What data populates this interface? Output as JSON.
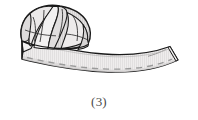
{
  "figure": {
    "caption": "(3)",
    "step_number": "3",
    "colors": {
      "outline": "#1a1a1a",
      "band_fill": "#eceaea",
      "band_fill_shadow": "#dedcdc",
      "rosette_fill": "#e6e4e4",
      "rosette_fill_dark": "#d2d0d0",
      "rosette_fill_light": "#f4f3f3",
      "stitch_dash": "#9b9b9b",
      "hatch": "#dcdada",
      "caption_text": "#4a4a4a",
      "background": "#ffffff"
    },
    "parts": {
      "rosette_label": "gathered-rosette",
      "band_label": "curved-band",
      "stitch_label": "dashed-stitch-line",
      "band_end_left_label": "band-left-end",
      "band_end_right_label": "band-right-end"
    }
  }
}
